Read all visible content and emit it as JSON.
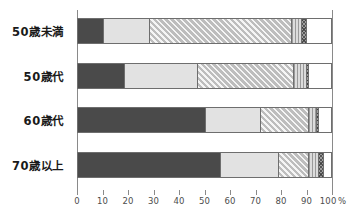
{
  "chart_data": {
    "type": "bar",
    "orientation": "horizontal",
    "stacked": true,
    "stack_mode": "percent",
    "title": "",
    "subtitle": "",
    "xlabel": "",
    "ylabel": "",
    "xlim": [
      0,
      100
    ],
    "grid": false,
    "legend": "none",
    "axis_unit": "%",
    "categories": [
      "50歳未満",
      "50歳代",
      "60歳代",
      "70歳以上"
    ],
    "tick_values": [
      0,
      10,
      20,
      30,
      40,
      50,
      60,
      70,
      80,
      90,
      100
    ],
    "tick_labels": [
      "0",
      "10",
      "20",
      "30",
      "40",
      "50",
      "60",
      "70",
      "80",
      "90",
      "100"
    ],
    "series": [
      {
        "name": "segment-1",
        "pattern": "solid-dark",
        "color": "#4a4a4a",
        "values": [
          10,
          18,
          50,
          56
        ]
      },
      {
        "name": "segment-2",
        "pattern": "solid-light",
        "color": "#e2e2e2",
        "values": [
          18,
          29,
          22,
          23
        ]
      },
      {
        "name": "segment-3",
        "pattern": "hatch-diagonal",
        "color": "#bdbdbd",
        "values": [
          56,
          38,
          19,
          12
        ]
      },
      {
        "name": "segment-4",
        "pattern": "hatch-vertical",
        "color": "#dcdcdc",
        "values": [
          4,
          5,
          3,
          4
        ]
      },
      {
        "name": "segment-5",
        "pattern": "crosshatch-dark",
        "color": "#9e9e9e",
        "values": [
          2,
          1,
          1,
          2
        ]
      },
      {
        "name": "segment-6",
        "pattern": "white",
        "color": "#ffffff",
        "values": [
          10,
          9,
          5,
          3
        ]
      }
    ]
  },
  "axis": {
    "unit_suffix": "%"
  }
}
